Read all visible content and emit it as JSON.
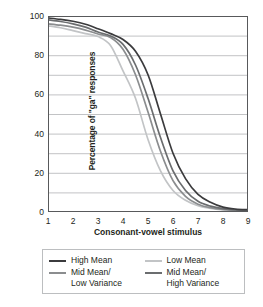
{
  "chart_data": {
    "type": "line",
    "title": "",
    "xlabel": "Consonant-vowel stimulus",
    "ylabel": "Percentage of \"ga\" responses",
    "xlim": [
      1,
      9
    ],
    "ylim": [
      0,
      100
    ],
    "grid": true,
    "grid_step_y": 10,
    "legend_position": "bottom",
    "x_ticks": [
      "1",
      "2",
      "3",
      "4",
      "5",
      "6",
      "7",
      "8",
      "9"
    ],
    "y_ticks": [
      "0",
      "20",
      "40",
      "60",
      "80",
      "100"
    ],
    "x": [
      1,
      1.5,
      2,
      2.5,
      3,
      3.5,
      4,
      4.5,
      5,
      5.5,
      6,
      6.5,
      7,
      7.5,
      8,
      8.5,
      9
    ],
    "series": [
      {
        "name": "High Mean",
        "color": "#3b3b3d",
        "values": [
          99,
          98.3,
          97.3,
          95.8,
          93.5,
          91,
          88,
          82,
          70,
          50,
          30,
          17,
          9,
          5,
          2.5,
          1.5,
          1.2
        ]
      },
      {
        "name": "Low Mean",
        "color": "#c2c4c6",
        "values": [
          95,
          94,
          92.5,
          91,
          89.5,
          85,
          72,
          58,
          37,
          21,
          11,
          6,
          3.2,
          1.8,
          1.1,
          0.8,
          0.7
        ]
      },
      {
        "name": "Mid Mean/\nLow Variance",
        "color": "#8b8d8f",
        "values": [
          96,
          95.3,
          94.3,
          92.8,
          90.8,
          89,
          83,
          70,
          51,
          31,
          16,
          8,
          4,
          2.2,
          1.3,
          0.9,
          0.9
        ]
      },
      {
        "name": "Mid Mean/\nHigh Variance",
        "color": "#6b6d6f",
        "values": [
          98,
          97.2,
          96,
          94.3,
          91.8,
          89.8,
          85.5,
          75,
          58,
          38,
          21,
          11,
          5.5,
          3,
          1.7,
          1.1,
          1.0
        ]
      }
    ]
  },
  "legend": {
    "entries": [
      {
        "label": "High Mean",
        "color": "#3b3b3d"
      },
      {
        "label": "Low Mean",
        "color": "#c2c4c6"
      },
      {
        "label": "Mid Mean/\nLow Variance",
        "color": "#8b8d8f"
      },
      {
        "label": "Mid Mean/\nHigh Variance",
        "color": "#6b6d6f"
      }
    ]
  },
  "style": {
    "axis_color": "#58595b",
    "grid_color": "#a7a9ac",
    "text_color": "#231f20",
    "legend_border": "#bcbec0"
  }
}
